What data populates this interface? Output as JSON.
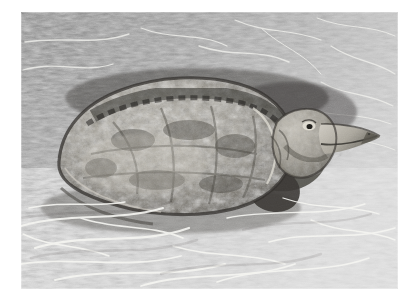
{
  "image": {
    "kind": "photograph",
    "color_mode": "black-and-white",
    "subject": "snapping turtle",
    "scene": "turtle resting on dry grass",
    "border_color": "#ffffff",
    "border_style": "white photographic print margin",
    "canvas": {
      "width": 420,
      "height": 302
    },
    "photo_area": {
      "left": 21,
      "top": 12,
      "width": 377,
      "height": 277
    }
  },
  "palette": {
    "paper_white": "#ffffff",
    "grass_light": "#e8e8e8",
    "grass_mid": "#a8a8a8",
    "grass_dark": "#4a4a4a",
    "shell_light": "#b8b4ac",
    "shell_mid": "#8e8a82",
    "shell_dark": "#3c3a36",
    "shadow": "#2a2a28",
    "highlight": "#f4f4f0"
  },
  "regions": [
    {
      "name": "upper-grass-band",
      "tone": "medium-dark mottled grass",
      "notes": "dense tangled blades, mid grey"
    },
    {
      "name": "turtle-carapace",
      "tone": "mottled mid grey dome",
      "notes": "oval shell occupying left-centre"
    },
    {
      "name": "turtle-head",
      "tone": "light grey with dark outline",
      "notes": "pointed beak facing right, small eye"
    },
    {
      "name": "turtle-foreleg",
      "tone": "dark grey",
      "notes": "below head, partially hidden in grass"
    },
    {
      "name": "lower-grass-band",
      "tone": "bright high-contrast straw",
      "notes": "crisp white blades over dark gaps"
    },
    {
      "name": "right-grass",
      "tone": "light grey",
      "notes": "fine straw, brighter toward lower right"
    }
  ],
  "labels": {
    "photo_alt": "Black and white photograph of a snapping turtle on dry grass",
    "subject_caption": "Snapping turtle"
  }
}
